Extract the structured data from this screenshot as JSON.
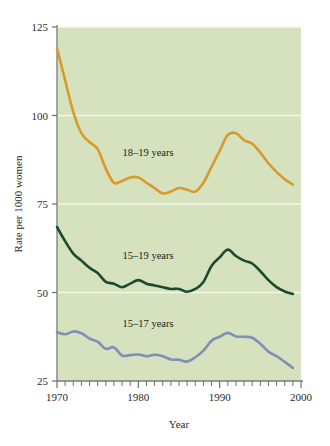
{
  "chart_data": {
    "type": "line",
    "title": "",
    "subtitle": "",
    "xlabel": "Year",
    "ylabel": "Rate per 1000 women",
    "xlim": [
      1970,
      2000
    ],
    "ylim": [
      25,
      125
    ],
    "grid": true,
    "grid_axis": "y",
    "legend": "inline-annotations",
    "x_ticks_major": [
      1970,
      1980,
      1990,
      2000
    ],
    "x_tick_labels": [
      "1970",
      "1980",
      "1990",
      "2000"
    ],
    "x_ticks_minor_step": 1,
    "y_ticks": [
      25,
      50,
      75,
      100,
      125
    ],
    "y_tick_labels": [
      "25",
      "50",
      "75",
      "100",
      "125"
    ],
    "plot_background_color": "#d6e2bd",
    "gridline_color": "#f4f7ec",
    "x": [
      1970,
      1971,
      1972,
      1973,
      1974,
      1975,
      1976,
      1977,
      1978,
      1979,
      1980,
      1981,
      1982,
      1983,
      1984,
      1985,
      1986,
      1987,
      1988,
      1989,
      1990,
      1991,
      1992,
      1993,
      1994,
      1995,
      1996,
      1997,
      1998,
      1999
    ],
    "series": [
      {
        "name": "18-19 years",
        "label": "18–19 years",
        "color": "#d79a2b",
        "label_x": 1981.2,
        "label_y": 88.5,
        "values": [
          119.0,
          110.0,
          101.0,
          95.0,
          92.5,
          90.5,
          85.0,
          81.0,
          81.5,
          82.5,
          82.5,
          81.0,
          79.5,
          78.0,
          78.5,
          79.5,
          79.0,
          78.5,
          81.0,
          85.5,
          90.0,
          94.5,
          95.0,
          93.0,
          92.0,
          89.5,
          86.5,
          84.0,
          82.0,
          80.5
        ]
      },
      {
        "name": "15-19 years",
        "label": "15–19 years",
        "color": "#1b4a32",
        "label_x": 1981.2,
        "label_y": 59.5,
        "values": [
          68.5,
          64.5,
          61.0,
          59.0,
          57.0,
          55.5,
          53.0,
          52.5,
          51.5,
          52.5,
          53.5,
          52.5,
          52.0,
          51.5,
          51.0,
          51.0,
          50.2,
          51.0,
          53.0,
          57.5,
          59.9,
          62.1,
          60.3,
          59.0,
          58.2,
          56.0,
          53.5,
          51.5,
          50.3,
          49.6
        ]
      },
      {
        "name": "15-17 years",
        "label": "15–17 years",
        "color": "#7e90b6",
        "label_x": 1981.2,
        "label_y": 40.2,
        "values": [
          38.8,
          38.2,
          39.0,
          38.5,
          37.0,
          36.1,
          34.1,
          34.5,
          32.2,
          32.3,
          32.5,
          32.0,
          32.4,
          32.0,
          31.1,
          31.0,
          30.5,
          31.7,
          33.6,
          36.4,
          37.5,
          38.6,
          37.6,
          37.5,
          37.2,
          35.5,
          33.3,
          32.0,
          30.4,
          28.7
        ]
      }
    ]
  },
  "axis": {
    "y_label": "Rate per 1000 women",
    "x_label": "Year"
  }
}
